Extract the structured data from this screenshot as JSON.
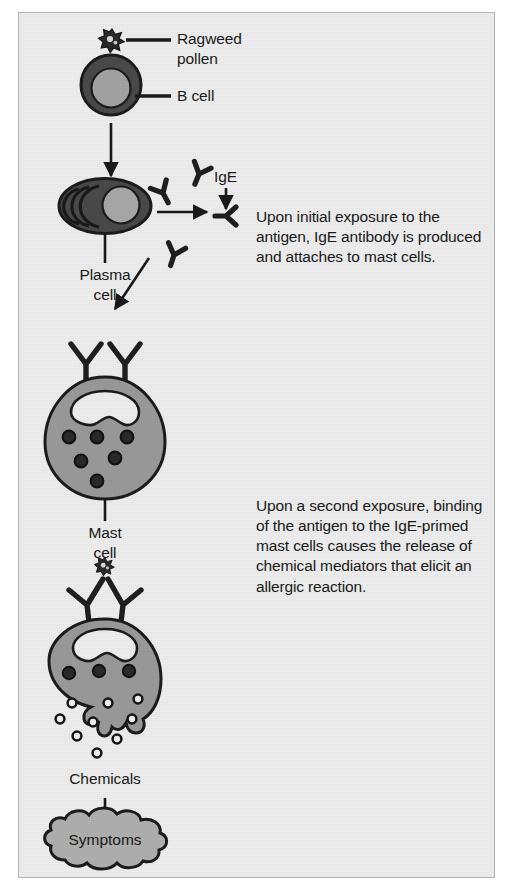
{
  "figure": {
    "background_color": "#eeeeee",
    "border_color": "#b4b4b4",
    "ink_color": "#1a1a1a",
    "cell_fill": "#9a9a9a",
    "cell_outline": "#262626",
    "nucleus_fill": "#a8a8a8"
  },
  "labels": {
    "ragweed_pollen": "Ragweed\npollen",
    "ragweed_pollen_line1": "Ragweed",
    "ragweed_pollen_line2": "pollen",
    "b_cell": "B cell",
    "ige": "IgE",
    "plasma_cell_line1": "Plasma",
    "plasma_cell_line2": "cell",
    "mast_cell_line1": "Mast",
    "mast_cell_line2": "cell",
    "chemicals": "Chemicals",
    "symptoms": "Symptoms"
  },
  "annotations": {
    "step1": "Upon initial exposure to the antigen, IgE antibody is produced and attaches to mast cells.",
    "step2": "Upon a second exposure, binding of the antigen to the IgE-primed mast cells causes the release of chemical mediators that elicit an allergic reaction."
  },
  "icons": {
    "pollen": "ragweed-pollen-icon",
    "b_cell": "b-cell-icon",
    "plasma_cell": "plasma-cell-icon",
    "antibody": "ige-antibody-icon",
    "mast_cell": "mast-cell-icon",
    "degranulating_mast_cell": "degranulating-mast-cell-icon",
    "granule": "chemical-granule-icon",
    "symptoms_cloud": "symptoms-cloud-icon",
    "arrow": "flow-arrow-icon",
    "leader": "leader-line-icon"
  },
  "flow": {
    "steps": [
      "Ragweed pollen binds B cell",
      "B cell becomes plasma cell",
      "Plasma cell secretes IgE",
      "IgE attaches to mast cell",
      "Second exposure triggers degranulation",
      "Chemicals released",
      "Symptoms"
    ]
  }
}
